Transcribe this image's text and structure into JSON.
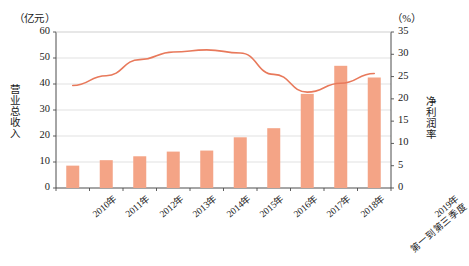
{
  "chart_data": {
    "type": "bar",
    "title": "",
    "categories": [
      "2010年",
      "2011年",
      "2012年",
      "2013年",
      "2014年",
      "2015年",
      "2016年",
      "2017年",
      "2018年",
      "2019年\n第一到第三季度"
    ],
    "series": [
      {
        "name": "营业总收入",
        "type": "bar",
        "axis": "left",
        "unit": "亿元",
        "values": [
          8.6,
          10.7,
          12.2,
          14.0,
          14.4,
          19.5,
          23.0,
          36.2,
          47.0,
          42.5
        ],
        "color": "#F4A486"
      },
      {
        "name": "净利润率",
        "type": "line",
        "axis": "right",
        "unit": "%",
        "values": [
          23.0,
          25.2,
          28.8,
          30.5,
          31.0,
          30.3,
          25.5,
          21.5,
          23.5,
          25.7
        ],
        "color": "#E8795B"
      }
    ],
    "left_axis": {
      "label": "营业总收入",
      "unit_header": "（亿元）",
      "ticks": [
        0,
        10,
        20,
        30,
        40,
        50,
        60
      ],
      "ylim": [
        0,
        60
      ]
    },
    "right_axis": {
      "label": "净利润率",
      "unit_header": "（%）",
      "ticks": [
        0,
        5,
        10,
        15,
        20,
        25,
        30,
        35
      ],
      "ylim": [
        0,
        35
      ]
    },
    "grid": true,
    "legend": "none",
    "xlabel": "",
    "tick_labels": {
      "left": [
        "60",
        "50",
        "40",
        "30",
        "20",
        "10",
        "0"
      ],
      "right": [
        "35",
        "30",
        "25",
        "20",
        "15",
        "10",
        "5",
        "0"
      ]
    },
    "x_labels": [
      {
        "line1": "2010年",
        "line2": ""
      },
      {
        "line1": "2011年",
        "line2": ""
      },
      {
        "line1": "2012年",
        "line2": ""
      },
      {
        "line1": "2013年",
        "line2": ""
      },
      {
        "line1": "2014年",
        "line2": ""
      },
      {
        "line1": "2015年",
        "line2": ""
      },
      {
        "line1": "2016年",
        "line2": ""
      },
      {
        "line1": "2017年",
        "line2": ""
      },
      {
        "line1": "2018年",
        "line2": ""
      },
      {
        "line1": "2019年",
        "line2": "第一到第三季度"
      }
    ]
  }
}
